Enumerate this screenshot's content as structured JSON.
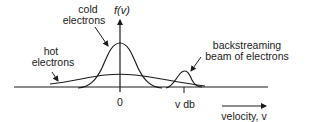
{
  "diagram": {
    "y_axis_label": "f(v)",
    "origin_label": "0",
    "beam_velocity_label": "v db",
    "x_axis_label": "velocity, v",
    "annotations": {
      "cold": [
        "cold",
        "electrons"
      ],
      "hot": [
        "hot",
        "electrons"
      ],
      "beam": [
        "backstreaming",
        "beam of electrons"
      ]
    },
    "colors": {
      "ink": "#1a1a1a",
      "background": "#ffffff"
    }
  }
}
